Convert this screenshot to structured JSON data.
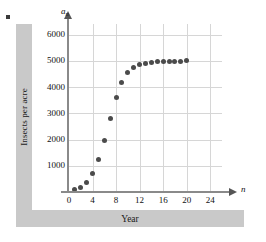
{
  "figure": {
    "marker": "bullet-marker",
    "y_band_label": "Insects per acre",
    "x_band_label": "Year"
  },
  "chart_data": {
    "type": "scatter",
    "title": "",
    "subtitle": "",
    "xlabel": "n",
    "ylabel": "a_n",
    "xlabel_band": "Year",
    "ylabel_band": "Insects per acre",
    "xlim": [
      0,
      26
    ],
    "ylim": [
      0,
      6400
    ],
    "grid": true,
    "legend": null,
    "xticks": [
      0,
      4,
      8,
      12,
      16,
      20,
      24
    ],
    "xtick_labels": [
      "0",
      "4",
      "8",
      "12",
      "16",
      "20",
      "24"
    ],
    "yticks": [
      1000,
      2000,
      3000,
      4000,
      5000,
      6000
    ],
    "ytick_labels": [
      "1000",
      "2000",
      "3000",
      "4000",
      "5000",
      "6000"
    ],
    "x": [
      1,
      2,
      3,
      4,
      5,
      6,
      7,
      8,
      9,
      10,
      11,
      12,
      13,
      14,
      15,
      16,
      17,
      18,
      19,
      20
    ],
    "values": [
      100,
      190,
      360,
      690,
      1250,
      1960,
      2810,
      3590,
      4190,
      4540,
      4740,
      4850,
      4910,
      4950,
      4970,
      4980,
      4985,
      4990,
      4990,
      4995
    ],
    "point_color": "#4b4b4b",
    "grid_color": "#d6d6d6",
    "axis_color": "#8a8a8a",
    "band_color": "#c9c9c9"
  }
}
